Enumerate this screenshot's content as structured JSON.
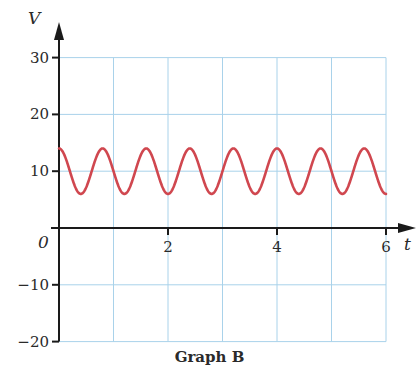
{
  "chart_data": {
    "type": "line",
    "title": "Graph B",
    "xlabel": "t",
    "ylabel": "V",
    "origin_label": "0",
    "xlim": [
      0,
      6
    ],
    "ylim": [
      -20,
      30
    ],
    "x_ticks": [
      2,
      4,
      6
    ],
    "x_tick_labels": [
      "2",
      "4",
      "6"
    ],
    "x_grid": [
      1,
      2,
      3,
      4,
      5,
      6
    ],
    "y_ticks": [
      30,
      20,
      10,
      -10,
      -20
    ],
    "y_tick_labels": [
      "30",
      "20",
      "10",
      "−10",
      "−20"
    ],
    "y_grid": [
      30,
      20,
      10,
      -10,
      -20
    ],
    "grid": true,
    "series": [
      {
        "name": "V(t)",
        "function": "10 + 4*cos(2*pi*t/0.8)",
        "offset": 10,
        "amplitude": 4,
        "period": 0.8,
        "max": 14,
        "min": 6,
        "t_start": 0,
        "t_end": 6,
        "color": "#d0474f"
      }
    ]
  },
  "colors": {
    "grid": "#a9d2ea",
    "axis": "#1a1a1a",
    "curve": "#d0474f"
  }
}
